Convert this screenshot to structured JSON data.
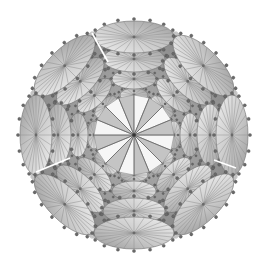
{
  "figure": {
    "width": 271,
    "height": 259,
    "center": [
      134,
      135
    ],
    "background": "#ffffff",
    "colors": {
      "disc_fill_light": "#eeeeee",
      "disc_fill_dark": "#9a9a9a",
      "disc_stroke": "#6e6e6e",
      "spoke": "#8a8a8a",
      "node_fill": "#6a6a6a",
      "node_stroke": "#4a4a4a",
      "fan_light": "#f6f6f6",
      "fan_dark": "#8c8c8c",
      "seam": "#ffffff",
      "shadow": "#7a7a7a"
    },
    "arms": {
      "count": 8,
      "start_angle_deg": 0,
      "discs": [
        {
          "dist": 98,
          "rx": 16,
          "ry": 40,
          "spokes": 24,
          "nodes": 16
        },
        {
          "dist": 76,
          "rx": 13,
          "ry": 31,
          "spokes": 20,
          "nodes": 14
        },
        {
          "dist": 56,
          "rx": 10,
          "ry": 22,
          "spokes": 16,
          "nodes": 12
        },
        {
          "dist": 40,
          "rx": 7,
          "ry": 14,
          "spokes": 12,
          "nodes": 10
        }
      ]
    },
    "fan": {
      "radius": 40,
      "wedges": 16
    },
    "seams": [
      {
        "from": [
          92,
          33
        ],
        "to": [
          108,
          62
        ]
      },
      {
        "from": [
          36,
          172
        ],
        "to": [
          70,
          158
        ]
      },
      {
        "from": [
          214,
          160
        ],
        "to": [
          236,
          168
        ]
      }
    ]
  }
}
